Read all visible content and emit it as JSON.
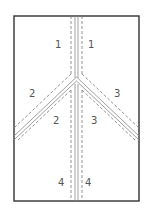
{
  "diagram": {
    "type": "fold-pattern",
    "frame_color": "#333333",
    "line_color": "#777777",
    "labels": [
      {
        "text": "1",
        "x": 58,
        "y": 48
      },
      {
        "text": "1",
        "x": 90,
        "y": 48
      },
      {
        "text": "2",
        "x": 31,
        "y": 96
      },
      {
        "text": "3",
        "x": 117,
        "y": 96
      },
      {
        "text": "2",
        "x": 56,
        "y": 124
      },
      {
        "text": "3",
        "x": 94,
        "y": 124
      },
      {
        "text": "4",
        "x": 61,
        "y": 186
      },
      {
        "text": "4",
        "x": 88,
        "y": 186
      }
    ]
  }
}
